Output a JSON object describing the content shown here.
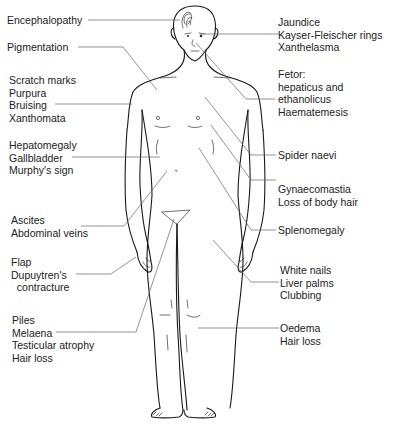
{
  "diagram": {
    "left_labels": [
      {
        "id": "encephalopathy",
        "lines": [
          "Encephalopathy"
        ]
      },
      {
        "id": "pigmentation",
        "lines": [
          "Pigmentation"
        ]
      },
      {
        "id": "skin",
        "lines": [
          "Scratch marks",
          "Purpura",
          "Bruising",
          "Xanthomata"
        ]
      },
      {
        "id": "liver",
        "lines": [
          "Hepatomegaly",
          "Gallbladder",
          "Murphy's sign"
        ]
      },
      {
        "id": "abdomen",
        "lines": [
          "Ascites",
          "Abdominal veins"
        ]
      },
      {
        "id": "hands",
        "lines": [
          "Flap",
          "Dupuytren's",
          "  contracture"
        ]
      },
      {
        "id": "rectal",
        "lines": [
          "Piles",
          "Melaena",
          "Testicular atrophy",
          "Hair loss"
        ]
      }
    ],
    "right_labels": [
      {
        "id": "eyes",
        "lines": [
          "Jaundice",
          "Kayser-Fleischer rings",
          "Xanthelasma"
        ]
      },
      {
        "id": "mouth",
        "lines": [
          "Fetor:",
          "hepaticus and",
          "ethanolicus",
          "Haematemesis"
        ]
      },
      {
        "id": "spider",
        "lines": [
          "Spider naevi"
        ]
      },
      {
        "id": "chest",
        "lines": [
          "Gynaecomastia",
          "Loss of body hair"
        ]
      },
      {
        "id": "spleen",
        "lines": [
          "Splenomegaly"
        ]
      },
      {
        "id": "nails",
        "lines": [
          "White nails",
          "Liver palms",
          "Clubbing"
        ]
      },
      {
        "id": "legs",
        "lines": [
          "Oedema",
          "Hair loss"
        ]
      }
    ]
  }
}
